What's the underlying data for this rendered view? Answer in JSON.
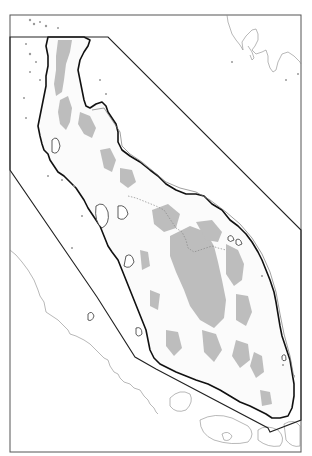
{
  "map": {
    "type": "outline map",
    "subject": "peninsula coastline with survey/zone boundary polygon",
    "labels": [],
    "colors": {
      "background": "#ffffff",
      "land": "#fbfbfb",
      "highland_shading": "#bdbdbd",
      "coastline": "#111111",
      "boundary_polygon": "#222222",
      "neighbor_coast": "#888888",
      "frame": "#555555"
    },
    "frame": {
      "x": 10,
      "y": 15,
      "width": 291,
      "height": 437
    },
    "boundary_polygon": [
      [
        10,
        37
      ],
      [
        108,
        37
      ],
      [
        301,
        230
      ],
      [
        301,
        420
      ],
      [
        270,
        432
      ],
      [
        268,
        428
      ],
      [
        156,
        369
      ],
      [
        135,
        357
      ],
      [
        97,
        297
      ],
      [
        10,
        170
      ]
    ],
    "features": [
      "main peninsula landmass",
      "gray shaded highland areas",
      "dotted internal border",
      "offshore islands along west coast",
      "neighboring island coastline at lower-left",
      "neighboring coastline at upper-right",
      "small islands at southern tip"
    ]
  }
}
